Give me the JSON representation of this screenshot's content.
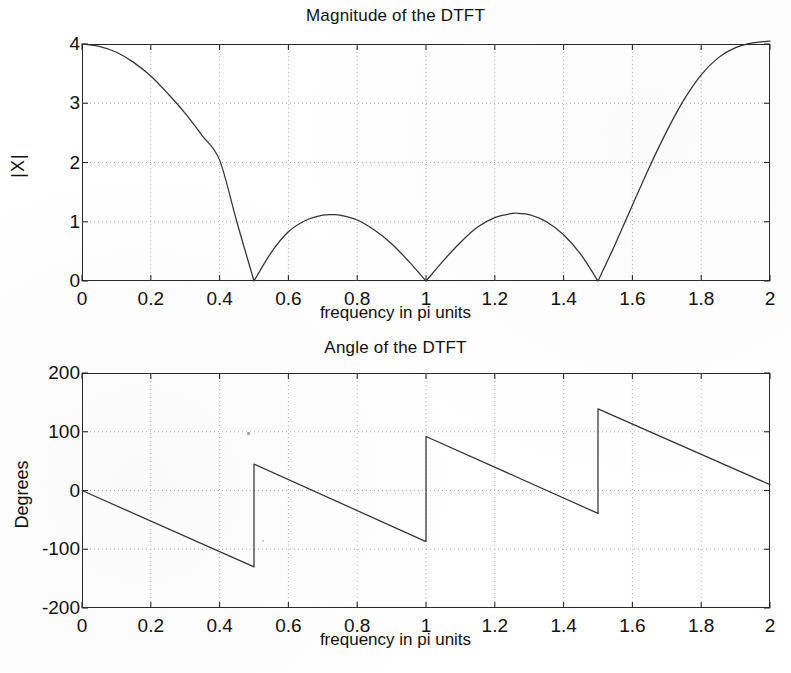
{
  "figure": {
    "xlabel": "frequency in pi units",
    "panels": [
      {
        "id": "magnitude",
        "title": "Magnitude of the DTFT",
        "ylabel": "|X|",
        "yticks": [
          "0",
          "1",
          "2",
          "3",
          "4"
        ],
        "xticks": [
          "0",
          "0.2",
          "0.4",
          "0.6",
          "0.8",
          "1",
          "1.2",
          "1.4",
          "1.6",
          "1.8",
          "2"
        ]
      },
      {
        "id": "angle",
        "title": "Angle of the DTFT",
        "ylabel": "Degrees",
        "yticks": [
          "-200",
          "-100",
          "0",
          "100",
          "200"
        ],
        "xticks": [
          "0",
          "0.2",
          "0.4",
          "0.6",
          "0.8",
          "1",
          "1.2",
          "1.4",
          "1.6",
          "1.8",
          "2"
        ]
      }
    ]
  },
  "chart_data": [
    {
      "type": "line",
      "title": "Magnitude of the DTFT",
      "xlabel": "frequency in pi units",
      "ylabel": "|X|",
      "xlim": [
        0,
        2
      ],
      "ylim": [
        0,
        4
      ],
      "xticks": [
        0,
        0.2,
        0.4,
        0.6,
        0.8,
        1,
        1.2,
        1.4,
        1.6,
        1.8,
        2
      ],
      "yticks": [
        0,
        1,
        2,
        3,
        4
      ],
      "grid": true,
      "legend": "none",
      "line_color": "#333333",
      "annotations": {
        "zeros": [
          0.5,
          1.0,
          1.5
        ],
        "main_lobe_peak": {
          "x": 0.0,
          "y": 4.0
        },
        "sidelobe_peaks": [
          {
            "x": 0.73,
            "y": 1.12
          },
          {
            "x": 1.27,
            "y": 1.14
          }
        ],
        "endpoint": {
          "x": 2.0,
          "y": 4.05
        }
      },
      "series": [
        {
          "name": "|X(e^jw)|",
          "x": [
            0,
            0.05,
            0.1,
            0.15,
            0.2,
            0.25,
            0.3,
            0.35,
            0.4,
            0.45,
            0.5,
            0.55,
            0.6,
            0.65,
            0.7,
            0.73,
            0.75,
            0.8,
            0.85,
            0.9,
            0.95,
            1.0,
            1.05,
            1.1,
            1.15,
            1.2,
            1.25,
            1.27,
            1.3,
            1.35,
            1.4,
            1.45,
            1.5,
            1.55,
            1.6,
            1.65,
            1.7,
            1.75,
            1.8,
            1.85,
            1.9,
            1.95,
            2.0
          ],
          "values": [
            4.0,
            3.96,
            3.86,
            3.69,
            3.46,
            3.16,
            2.83,
            2.45,
            2.04,
            1.0,
            0.0,
            0.48,
            0.83,
            1.02,
            1.11,
            1.12,
            1.11,
            1.03,
            0.86,
            0.63,
            0.33,
            0.0,
            0.34,
            0.65,
            0.91,
            1.07,
            1.14,
            1.14,
            1.12,
            1.0,
            0.78,
            0.45,
            0.0,
            0.62,
            1.28,
            1.93,
            2.53,
            3.06,
            3.48,
            3.77,
            3.94,
            4.02,
            4.05
          ]
        }
      ]
    },
    {
      "type": "line",
      "title": "Angle of the DTFT",
      "xlabel": "frequency in pi units",
      "ylabel": "Degrees",
      "xlim": [
        0,
        2
      ],
      "ylim": [
        -200,
        200
      ],
      "xticks": [
        0,
        0.2,
        0.4,
        0.6,
        0.8,
        1,
        1.2,
        1.4,
        1.6,
        1.8,
        2
      ],
      "yticks": [
        -200,
        -100,
        0,
        100,
        200
      ],
      "grid": true,
      "legend": "none",
      "line_color": "#333333",
      "annotations": {
        "discontinuities": [
          {
            "x": 0.5,
            "from": -130,
            "to": 45
          },
          {
            "x": 1.0,
            "from": -87,
            "to": 92
          },
          {
            "x": 1.5,
            "from": -39,
            "to": 139
          }
        ],
        "start": {
          "x": 0.0,
          "y": 0
        },
        "end": {
          "x": 2.0,
          "y": 10
        }
      },
      "series": [
        {
          "name": "angle X(e^jw) (degrees)",
          "segments": [
            {
              "x": [
                0.0,
                0.5
              ],
              "values": [
                0,
                -130
              ]
            },
            {
              "x": [
                0.5,
                1.0
              ],
              "values": [
                45,
                -87
              ]
            },
            {
              "x": [
                1.0,
                1.5
              ],
              "values": [
                92,
                -39
              ]
            },
            {
              "x": [
                1.5,
                2.0
              ],
              "values": [
                139,
                10
              ]
            }
          ]
        }
      ]
    }
  ]
}
